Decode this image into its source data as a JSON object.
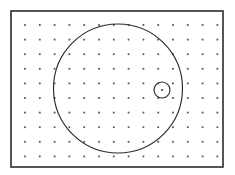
{
  "figure": {
    "canvas": {
      "width": 235,
      "height": 175,
      "background": "#ffffff"
    },
    "frame": {
      "name": "outer-frame",
      "x": 11,
      "y": 11,
      "width": 212,
      "height": 156,
      "stroke_color": "#2b2b2b",
      "stroke_width": 1.6,
      "fill_color": "#ffffff"
    },
    "dot_grid": {
      "name": "dot-grid",
      "columns": 14,
      "rows": 10,
      "origin_x": 25,
      "origin_y": 25,
      "spacing_x": 14.8,
      "spacing_y": 14.6,
      "dot_radius": 0.9,
      "dot_color": "#5a5a5a"
    },
    "shapes": [
      {
        "name": "large-circle",
        "type": "circle",
        "cx": 118,
        "cy": 88.5,
        "r": 64.5,
        "stroke_color": "#2b2b2b",
        "stroke_width": 1.15,
        "fill": "none"
      },
      {
        "name": "small-circle",
        "type": "circle",
        "cx": 162,
        "cy": 90,
        "r": 8,
        "stroke_color": "#2b2b2b",
        "stroke_width": 1.15,
        "fill": "none"
      },
      {
        "name": "small-circle-center-dot",
        "type": "dot",
        "cx": 162,
        "cy": 90,
        "r": 1.1,
        "fill": "#4a4a4a"
      }
    ]
  },
  "chart_data": {
    "type": "scatter",
    "xlabel": "",
    "ylabel": "",
    "xlim": [
      11,
      223
    ],
    "ylim": [
      11,
      167
    ],
    "grid": true,
    "legend": null,
    "annotations": [
      "Outer rectangular frame",
      "Regular 14 x 10 dot lattice",
      "Large circle, center (118, 88.5), radius 64.5",
      "Small circle, center (162, 90), radius 8, with center dot"
    ],
    "series": [
      {
        "name": "grid-dots",
        "description": "Regular lattice of 140 dots, spacing 14.8 x 14.6 px",
        "count": 140
      },
      {
        "name": "large-circle",
        "description": "Circle outline",
        "cx": 118,
        "cy": 88.5,
        "r": 64.5
      },
      {
        "name": "small-circle",
        "description": "Circle outline near right edge of large circle",
        "cx": 162,
        "cy": 90,
        "r": 8
      }
    ]
  }
}
